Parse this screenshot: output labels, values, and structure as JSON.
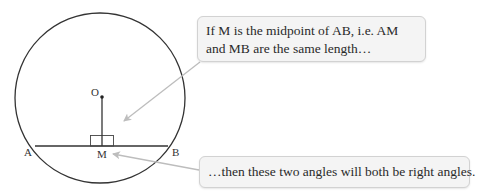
{
  "diagram": {
    "points": {
      "O": "O",
      "A": "A",
      "B": "B",
      "M": "M"
    },
    "callouts": {
      "top": "If M is the midpoint of AB, i.e. AM and MB are the same length…",
      "bottom": "…then these two angles will both be right angles."
    },
    "colors": {
      "stroke": "#333333",
      "arrow": "#bdbdbd",
      "callout_bg": "#f4f4f4",
      "callout_border": "#d2d2d2"
    }
  }
}
